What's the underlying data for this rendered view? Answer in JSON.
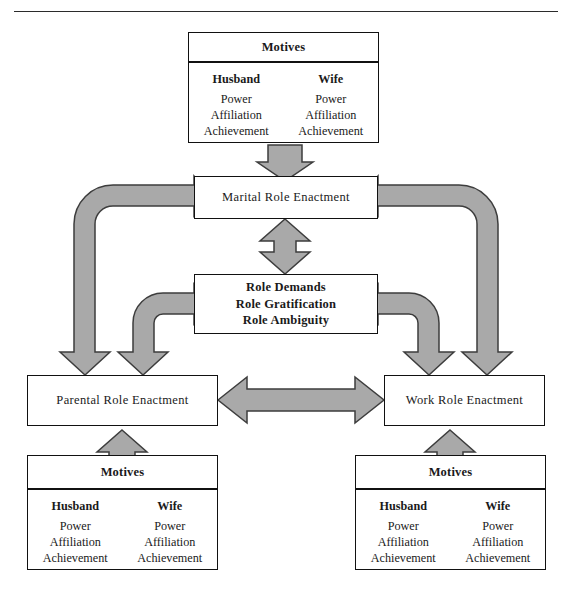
{
  "figure": {
    "title_rule": true,
    "accent_arrow_fill": "#a9a9a9",
    "accent_arrow_stroke": "#3d3d3d",
    "box_border": "#111111"
  },
  "motives_label": "Motives",
  "motive_columns": [
    {
      "who": "Husband",
      "items": [
        "Power",
        "Affiliation",
        "Achievement"
      ]
    },
    {
      "who": "Wife",
      "items": [
        "Power",
        "Affiliation",
        "Achievement"
      ]
    }
  ],
  "top_motives": {
    "header": "Motives",
    "columns": [
      {
        "who": "Husband",
        "m1": "Power",
        "m2": "Affiliation",
        "m3": "Achievement"
      },
      {
        "who": "Wife",
        "m1": "Power",
        "m2": "Affiliation",
        "m3": "Achievement"
      }
    ]
  },
  "left_motives": {
    "header": "Motives",
    "columns": [
      {
        "who": "Husband",
        "m1": "Power",
        "m2": "Affiliation",
        "m3": "Achievement"
      },
      {
        "who": "Wife",
        "m1": "Power",
        "m2": "Affiliation",
        "m3": "Achievement"
      }
    ]
  },
  "right_motives": {
    "header": "Motives",
    "columns": [
      {
        "who": "Husband",
        "m1": "Power",
        "m2": "Affiliation",
        "m3": "Achievement"
      },
      {
        "who": "Wife",
        "m1": "Power",
        "m2": "Affiliation",
        "m3": "Achievement"
      }
    ]
  },
  "nodes": {
    "marital": "Marital Role Enactment",
    "parental": "Parental Role Enactment",
    "work": "Work Role Enactment",
    "role_demands_line1": "Role Demands",
    "role_demands_line2": "Role Gratification",
    "role_demands_line3": "Role Ambiguity"
  },
  "connectors": [
    {
      "name": "top-motives-to-marital",
      "direction": "down"
    },
    {
      "name": "marital-to-role-demands",
      "direction": "bidirectional-vertical"
    },
    {
      "name": "parental-to-work",
      "direction": "bidirectional-horizontal"
    },
    {
      "name": "left-motives-to-parental",
      "direction": "up"
    },
    {
      "name": "right-motives-to-work",
      "direction": "up"
    },
    {
      "name": "marital-to-parental",
      "direction": "bidirectional-curved-left-outer"
    },
    {
      "name": "role-demands-to-parental",
      "direction": "bidirectional-curved-left-inner"
    },
    {
      "name": "marital-to-work",
      "direction": "bidirectional-curved-right-outer"
    },
    {
      "name": "role-demands-to-work",
      "direction": "bidirectional-curved-right-inner"
    }
  ]
}
